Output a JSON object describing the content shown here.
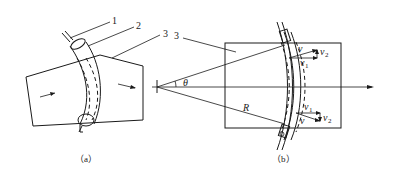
{
  "figure": {
    "panel_a": {
      "caption": "（a）",
      "callouts": [
        "1",
        "2",
        "3"
      ]
    },
    "panel_b": {
      "caption": "（b）",
      "callout": "3",
      "angle_label": "θ",
      "radius_label": "R",
      "top_vectors": {
        "v": "v",
        "v1": "v",
        "v1_sub": "1",
        "v2": "v",
        "v2_sub": "2"
      },
      "bottom_vectors": {
        "v": "v",
        "v1": "v",
        "v1_sub": "1",
        "v2": "v",
        "v2_sub": "2"
      }
    }
  }
}
